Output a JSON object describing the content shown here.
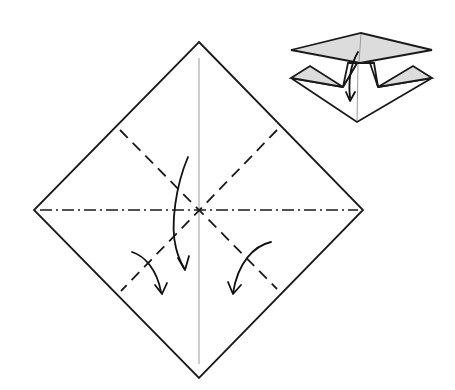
{
  "diagram": {
    "type": "origami-instruction",
    "colors": {
      "line": "#1a1a1a",
      "crease": "#9a9a9a",
      "paper": "#ffffff",
      "shaded_paper": "#dcdcdc"
    },
    "main_square": {
      "corners": {
        "top": [
          199,
          42
        ],
        "right": [
          363,
          210
        ],
        "bottom": [
          199,
          378
        ],
        "left": [
          34,
          210
        ]
      },
      "center": [
        199,
        210
      ]
    },
    "creases": [
      {
        "name": "vertical-center-crease",
        "style": "thin-existing",
        "from": [
          199,
          60
        ],
        "to": [
          199,
          362
        ]
      },
      {
        "name": "horizontal-mountain-fold",
        "style": "mountain (dash-dot)",
        "from": [
          34,
          210
        ],
        "to": [
          363,
          210
        ]
      },
      {
        "name": "diagonal-valley-fold-1",
        "style": "valley (dashed)",
        "from": [
          120,
          130
        ],
        "to": [
          277,
          289
        ]
      },
      {
        "name": "diagonal-valley-fold-2",
        "style": "valley (dashed)",
        "from": [
          277,
          130
        ],
        "to": [
          121,
          291
        ]
      }
    ],
    "arrows": [
      {
        "name": "center-fold-down-arrow",
        "direction": "down"
      },
      {
        "name": "left-fold-arrow",
        "direction": "down-right"
      },
      {
        "name": "right-fold-arrow",
        "direction": "down-left"
      }
    ],
    "result_preview": {
      "name": "collapsed-square-base-preview",
      "position": "top-right",
      "has_arrow": true
    }
  }
}
